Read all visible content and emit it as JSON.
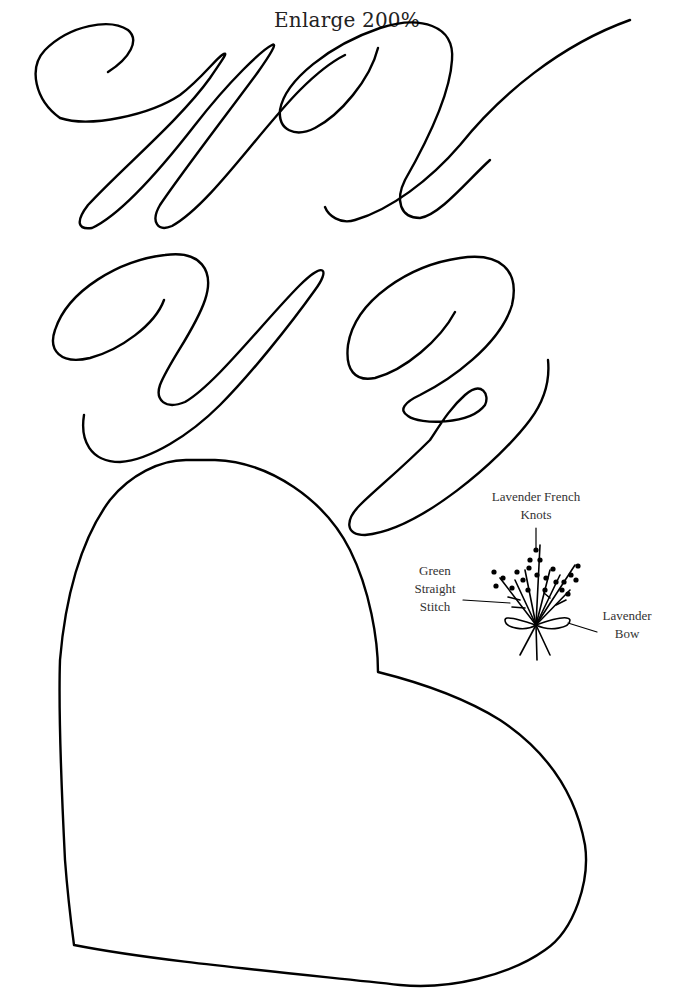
{
  "page": {
    "title": "Enlarge 200%"
  },
  "letters": [
    "W",
    "X",
    "Y",
    "Z"
  ],
  "shapes": [
    "heart-template"
  ],
  "embroidery": {
    "labels": {
      "knots": [
        "Lavender French",
        "Knots"
      ],
      "stitch": [
        "Green",
        "Straight",
        "Stitch"
      ],
      "bow": [
        "Lavender",
        "Bow"
      ]
    }
  },
  "colors": {
    "line": "#000000",
    "background": "#ffffff",
    "text": "#333333"
  }
}
